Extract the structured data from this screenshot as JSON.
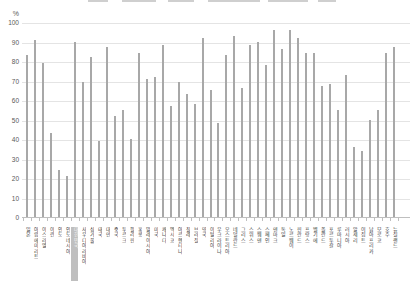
{
  "chart_data": {
    "type": "bar",
    "unit_label": "%",
    "ylim": [
      0,
      100
    ],
    "yticks": [
      0,
      10,
      20,
      30,
      40,
      50,
      60,
      70,
      80,
      90,
      100
    ],
    "grid": true,
    "legend": false,
    "categories": [
      "일본",
      "아랍에미리트",
      "이스라엘",
      "이란",
      "인도",
      "인도네시아",
      "대한민국",
      "사우디아라비아",
      "싱가풀",
      "태국",
      "대만",
      "중국",
      "투르크",
      "필리핀",
      "홍콩",
      "말레이시아",
      "미국",
      "캐나다",
      "멕시코",
      "아르헨티나",
      "칠레",
      "브라질",
      "영국",
      "이탈리아",
      "우크라이나",
      "오스트리아",
      "네덜란드",
      "그리스",
      "스위스",
      "스웨덴",
      "스페인",
      "덴마크",
      "독일",
      "노르웨이",
      "핀란드",
      "프랑스",
      "벨기에",
      "폴란드",
      "포르투갈",
      "루마니아",
      "러시아",
      "알제리",
      "이집트",
      "남아프리카",
      "모로코",
      "호주",
      "뉴질랜드"
    ],
    "values": [
      83,
      91,
      79,
      43,
      24,
      21,
      90,
      69,
      82,
      39,
      87,
      52,
      55,
      40,
      84,
      71,
      72,
      88,
      57,
      69,
      63,
      58,
      92,
      65,
      48,
      83,
      93,
      66,
      88,
      90,
      78,
      96,
      86,
      96,
      92,
      84,
      84,
      67,
      68,
      55,
      73,
      36,
      34,
      50,
      55,
      84,
      87
    ],
    "highlighted_category": "대한민국",
    "colors": {
      "bar": "#a8a8a8",
      "gridline": "#e4e4e4",
      "axis": "#bfbfbf",
      "tick": "#bfbfbf",
      "highlight_label_bg": "#bfbfbf",
      "highlight_label_text": "#f5f5f5"
    }
  }
}
